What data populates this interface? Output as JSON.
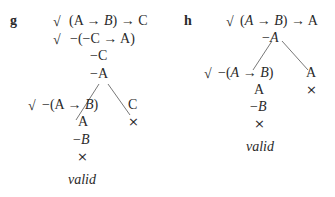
{
  "trees": [
    {
      "label": "g",
      "lines": [
        {
          "check": "√",
          "pre": "(A → ",
          "var": "B",
          "post": ") → C"
        },
        {
          "check": "√",
          "text": "−(−C → A)"
        },
        {
          "text": "−C"
        },
        {
          "text": "−A"
        }
      ],
      "left_branch": [
        {
          "check": "√",
          "text": "−(A → B)"
        },
        {
          "text": "A"
        },
        {
          "text": "−B"
        },
        {
          "text": "×"
        }
      ],
      "right_branch": [
        {
          "text": "C"
        },
        {
          "text": "×"
        }
      ],
      "verdict": "valid"
    },
    {
      "label": "h",
      "lines": [
        {
          "check": "√",
          "text": "(A → B) → A"
        },
        {
          "text": "−A"
        }
      ],
      "left_branch": [
        {
          "check": "√",
          "text": "−(A → B)"
        },
        {
          "text": "A"
        },
        {
          "text": "−B"
        },
        {
          "text": "×"
        }
      ],
      "right_branch": [
        {
          "text": "A"
        },
        {
          "text": "×"
        }
      ],
      "verdict": "valid"
    }
  ]
}
